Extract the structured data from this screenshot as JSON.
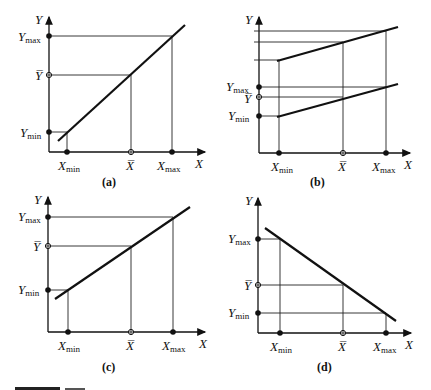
{
  "figure": {
    "panels": [
      {
        "id": "a",
        "caption": "(a)",
        "y_label": "Y",
        "x_label": "X",
        "y_ticks": [
          "Ymax",
          "Ȳ",
          "Ymin"
        ],
        "x_ticks": [
          "Xmin",
          "X̄",
          "Xmax"
        ],
        "description": "positive slope regression line through (Xmin,Ymin),(X̄,Ȳ),(Xmax,Ymax)"
      },
      {
        "id": "b",
        "caption": "(b)",
        "y_label": "Y",
        "x_label": "X",
        "y_ticks": [
          "Ymax",
          "Ȳ",
          "Ymin"
        ],
        "x_ticks": [
          "Xmin",
          "X̄",
          "Xmax"
        ],
        "description": "two parallel shallow-slope lines; lower line maps to Ymin, Ȳ, Ymax; upper line shifted up"
      },
      {
        "id": "c",
        "caption": "(c)",
        "y_label": "Y",
        "x_label": "X",
        "y_ticks": [
          "Ymax",
          "Ȳ",
          "Ymin"
        ],
        "x_ticks": [
          "Xmin",
          "X̄",
          "Xmax"
        ],
        "description": "positive slope regression line with intercept above origin"
      },
      {
        "id": "d",
        "caption": "(d)",
        "y_label": "Y",
        "x_label": "X",
        "y_ticks": [
          "Ymax",
          "Ȳ",
          "Ymin"
        ],
        "x_ticks": [
          "Xmin",
          "X̄",
          "Xmax"
        ],
        "description": "negative slope line: Xmin maps to Ymax, Xmax maps to Ymin"
      }
    ]
  },
  "labels": {
    "Y": "Y",
    "X": "X",
    "Ymax_main": "Y",
    "Ymax_sub": "max",
    "Ymin_main": "Y",
    "Ymin_sub": "min",
    "Ybar": "Y̅",
    "Xmin_main": "X",
    "Xmin_sub": "min",
    "Xmax_main": "X",
    "Xmax_sub": "max",
    "Xbar": "X̅"
  },
  "captions": {
    "a": "(a)",
    "b": "(b)",
    "c": "(c)",
    "d": "(d)"
  }
}
